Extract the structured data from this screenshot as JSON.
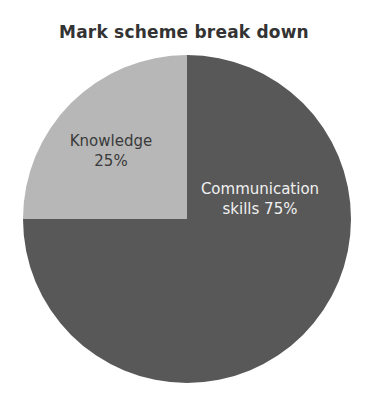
{
  "chart_data": {
    "type": "pie",
    "title": "Mark scheme break down",
    "categories": [
      "Knowledge",
      "Communication skills"
    ],
    "values": [
      25,
      75
    ],
    "labels": [
      "Knowledge 25%",
      "Communication skills 75%"
    ],
    "colors": [
      "#b7b7b7",
      "#585858"
    ],
    "start_angle_deg": 90,
    "direction": "counterclockwise",
    "legend": "none"
  },
  "labels": {
    "knowledge_line1": "Knowledge",
    "knowledge_line2": "25%",
    "communication_line1": "Communication",
    "communication_line2": "skills 75%"
  }
}
